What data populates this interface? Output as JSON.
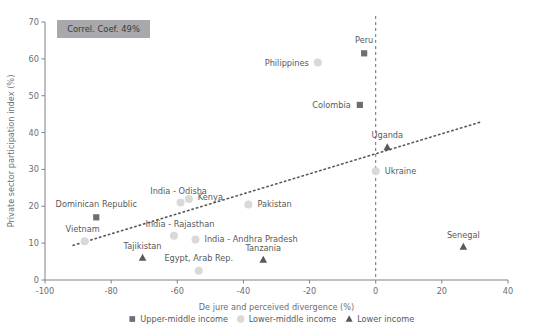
{
  "chart_data": {
    "type": "scatter",
    "title": "",
    "xlabel": "De jure and perceived divergence (%)",
    "ylabel": "Private sector participation index (%)",
    "xlim": [
      -100,
      40
    ],
    "ylim": [
      0,
      70
    ],
    "xticks": [
      -100,
      -80,
      -60,
      -40,
      -20,
      0,
      20,
      40
    ],
    "xticklabels": [
      "-100",
      "-80",
      "-60",
      "-40",
      "-20",
      "0",
      "20",
      "40"
    ],
    "yticks": [
      0,
      10,
      20,
      30,
      40,
      50,
      60,
      70
    ],
    "yticklabels": [
      "0",
      "10",
      "20",
      "30",
      "40",
      "50",
      "60",
      "70"
    ],
    "grid": false,
    "annotation": "Correl. Coef. 49%",
    "reference_line_x": 0,
    "trendline": {
      "x": [
        -91.5,
        31.5
      ],
      "y": [
        9.4,
        42.8
      ]
    },
    "legend": {
      "position": "bottom",
      "entries": [
        {
          "label": "Upper-middle income",
          "marker": "square"
        },
        {
          "label": "Lower-middle income",
          "marker": "circle"
        },
        {
          "label": "Lower income",
          "marker": "triangle"
        }
      ]
    },
    "series": [
      {
        "name": "Upper-middle income",
        "marker": "square",
        "points": [
          {
            "label": "Peru",
            "x": -3.5,
            "y": 61.5,
            "label_dx": 0,
            "label_dy": -10,
            "label_anchor": "middle"
          },
          {
            "label": "Colombia",
            "x": -4.8,
            "y": 47.5,
            "label_dx": -9,
            "label_dy": 3,
            "label_anchor": "end"
          },
          {
            "label": "Dominican Republic",
            "x": -84.5,
            "y": 17.0,
            "label_dx": 0,
            "label_dy": -10,
            "label_anchor": "middle"
          }
        ]
      },
      {
        "name": "Lower-middle income",
        "marker": "circle",
        "points": [
          {
            "label": "Philippines",
            "x": -17.5,
            "y": 59.0,
            "label_dx": -9,
            "label_dy": 3,
            "label_anchor": "end"
          },
          {
            "label": "Ukraine",
            "x": 0.0,
            "y": 29.5,
            "label_dx": 9,
            "label_dy": 3,
            "label_anchor": "start"
          },
          {
            "label": "Kenya",
            "x": -56.5,
            "y": 22.0,
            "label_dx": 9,
            "label_dy": 1,
            "label_anchor": "start"
          },
          {
            "label": "India - Odisha",
            "x": -59.0,
            "y": 21.0,
            "label_dx": -2,
            "label_dy": -9,
            "label_anchor": "middle"
          },
          {
            "label": "Pakistan",
            "x": -38.5,
            "y": 20.5,
            "label_dx": 9,
            "label_dy": 3,
            "label_anchor": "start"
          },
          {
            "label": "India - Rajasthan",
            "x": -61.0,
            "y": 12.0,
            "label_dx": 6,
            "label_dy": -9,
            "label_anchor": "middle"
          },
          {
            "label": "India - Andhra Pradesh",
            "x": -54.5,
            "y": 11.0,
            "label_dx": 9,
            "label_dy": 3,
            "label_anchor": "start"
          },
          {
            "label": "Vietnam",
            "x": -88.0,
            "y": 10.5,
            "label_dx": -2,
            "label_dy": -9,
            "label_anchor": "middle"
          },
          {
            "label": "Egypt, Arab Rep.",
            "x": -53.5,
            "y": 2.5,
            "label_dx": 0,
            "label_dy": -10,
            "label_anchor": "middle"
          }
        ]
      },
      {
        "name": "Lower income",
        "marker": "triangle",
        "points": [
          {
            "label": "Uganda",
            "x": 3.5,
            "y": 36.0,
            "label_dx": 0,
            "label_dy": -9,
            "label_anchor": "middle"
          },
          {
            "label": "Senegal",
            "x": 26.5,
            "y": 9.0,
            "label_dx": 0,
            "label_dy": -9,
            "label_anchor": "middle"
          },
          {
            "label": "Tajikistan",
            "x": -70.5,
            "y": 6.0,
            "label_dx": 0,
            "label_dy": -9,
            "label_anchor": "middle"
          },
          {
            "label": "Tanzania",
            "x": -34.0,
            "y": 5.5,
            "label_dx": 0,
            "label_dy": -9,
            "label_anchor": "middle"
          }
        ]
      }
    ],
    "colors": {
      "upper_middle": "#6d6e71",
      "lower_middle": "#d9d9d9",
      "lower": "#58595b",
      "annotation_box": "#a7a9ac",
      "axis": "#808285",
      "text": "#58595b"
    }
  }
}
